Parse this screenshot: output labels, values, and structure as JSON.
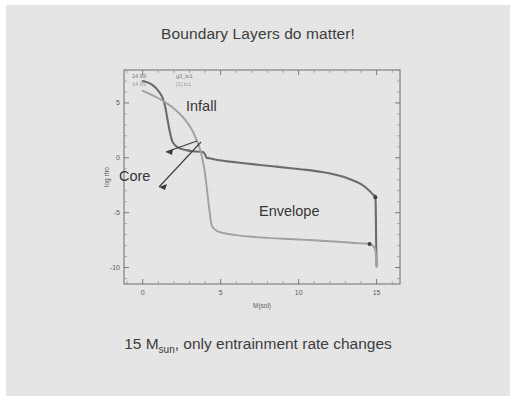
{
  "slide": {
    "title": "Boundary Layers do matter!",
    "caption_main": "15 M",
    "caption_sub": "sun",
    "caption_rest": ", only entrainment rate changes",
    "background_color": "#e9e9e9"
  },
  "annotations": {
    "infall": "Infall",
    "core": "Core",
    "envelope": "Envelope"
  },
  "plot_corner": {
    "line1_value": "14.99",
    "line1_model": "g3_lo1",
    "line2_value": "14.99",
    "line2_model": "[1] lo1"
  },
  "chart_data": {
    "type": "line",
    "title": "",
    "xlabel": "M(sol)",
    "ylabel": "log rho",
    "xlim": [
      -1.2,
      16.5
    ],
    "ylim": [
      -11.5,
      8.0
    ],
    "xticks": [
      0,
      5,
      10,
      15
    ],
    "yticks": [
      5,
      0,
      -5,
      -10
    ],
    "grid": false,
    "legend": "none",
    "series": [
      {
        "name": "g3_lo1",
        "color": "#6b6b6b",
        "endpoint": {
          "x": 14.92,
          "y": -3.6
        },
        "x": [
          0.0,
          0.35,
          0.7,
          1.0,
          1.25,
          1.45,
          1.6,
          1.75,
          1.9,
          2.1,
          2.4,
          2.8,
          3.2,
          3.6,
          3.9,
          4.05,
          4.1,
          4.3,
          4.8,
          5.6,
          6.5,
          7.5,
          8.5,
          9.5,
          10.5,
          11.5,
          12.5,
          13.3,
          14.0,
          14.5,
          14.8,
          14.92,
          14.95,
          14.97,
          15.0
        ],
        "y": [
          7.0,
          6.85,
          6.55,
          6.1,
          5.55,
          4.6,
          3.4,
          2.3,
          1.5,
          1.1,
          0.85,
          0.7,
          0.6,
          0.55,
          0.5,
          0.15,
          0.0,
          -0.05,
          -0.2,
          -0.35,
          -0.5,
          -0.65,
          -0.8,
          -0.95,
          -1.1,
          -1.3,
          -1.6,
          -1.95,
          -2.4,
          -2.95,
          -3.4,
          -3.6,
          -5.2,
          -7.6,
          -9.9
        ]
      },
      {
        "name": "[1] lo1",
        "color": "#a2a2a2",
        "endpoint": {
          "x": 14.55,
          "y": -7.85
        },
        "x": [
          0.0,
          0.4,
          0.9,
          1.4,
          1.9,
          2.3,
          2.7,
          3.05,
          3.35,
          3.6,
          3.8,
          3.95,
          4.1,
          4.2,
          4.3,
          4.35,
          4.4,
          4.5,
          4.8,
          5.3,
          6.0,
          7.0,
          8.0,
          9.0,
          10.0,
          11.0,
          12.0,
          13.0,
          14.0,
          14.55,
          14.9,
          15.0
        ],
        "y": [
          6.1,
          5.85,
          5.5,
          5.1,
          4.6,
          4.1,
          3.5,
          2.8,
          2.0,
          1.1,
          0.1,
          -1.0,
          -2.6,
          -3.9,
          -5.0,
          -5.6,
          -6.0,
          -6.35,
          -6.7,
          -6.9,
          -7.05,
          -7.2,
          -7.3,
          -7.38,
          -7.45,
          -7.52,
          -7.6,
          -7.7,
          -7.8,
          -7.85,
          -8.3,
          -9.9
        ]
      }
    ]
  }
}
